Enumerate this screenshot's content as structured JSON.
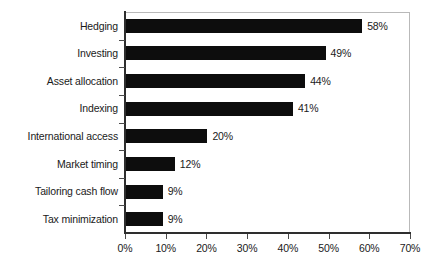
{
  "chart_data": {
    "type": "bar",
    "orientation": "horizontal",
    "title": "",
    "subtitle": "",
    "xlabel": "",
    "ylabel": "",
    "xlim": [
      0,
      70
    ],
    "xtick_step": 10,
    "grid": false,
    "legend": null,
    "categories": [
      "Hedging",
      "Investing",
      "Asset allocation",
      "Indexing",
      "International access",
      "Market timing",
      "Tailoring cash flow",
      "Tax minimization"
    ],
    "values": [
      58,
      49,
      44,
      41,
      20,
      12,
      9,
      9
    ],
    "data_labels": [
      "58%",
      "49%",
      "44%",
      "41%",
      "20%",
      "12%",
      "9%",
      "9%"
    ],
    "xtick_labels": [
      "0%",
      "10%",
      "20%",
      "30%",
      "40%",
      "50%",
      "60%",
      "70%"
    ],
    "xtick_values": [
      0,
      10,
      20,
      30,
      40,
      50,
      60,
      70
    ],
    "bar_color": "#0d0d0d",
    "axis_color": "#2e2e2e",
    "frame_color": "#b9b9b9",
    "background_color": "#ffffff",
    "text_color": "#1a1a1a"
  }
}
